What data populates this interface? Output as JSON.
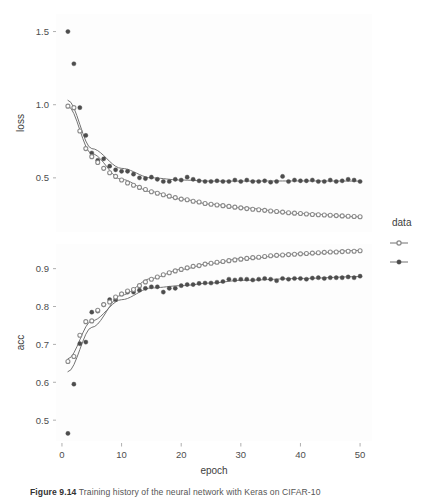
{
  "figure": {
    "caption_label": "Figure 9.14",
    "caption_text": "Training history of the neural network with Keras on CIFAR-10"
  },
  "legend": {
    "title": "data",
    "items": [
      {
        "label": "",
        "marker": "open-circle"
      },
      {
        "label": "",
        "marker": "filled-circle"
      }
    ]
  },
  "axes": {
    "xlabel": "epoch",
    "x_ticks": [
      "0",
      "10",
      "20",
      "30",
      "40",
      "50"
    ],
    "loss_label": "loss",
    "loss_ticks": [
      "1.5",
      "1.0",
      "0.5"
    ],
    "acc_label": "acc",
    "acc_ticks": [
      "0.9",
      "0.8",
      "0.7",
      "0.6",
      "0.5"
    ]
  },
  "colors": {
    "validation": "#4d4d4d",
    "training": "#8a8a8a",
    "smooth_line": "#737373",
    "panel_background": "#fdfdfd",
    "text": "#4d4d4d"
  },
  "chart_data": {
    "type": "scatter",
    "title": "",
    "xlabel": "epoch",
    "panels": [
      {
        "name": "loss",
        "ylabel": "loss",
        "ylim": [
          0.13,
          1.62
        ],
        "yticks": [
          0.5,
          1.0,
          1.5
        ],
        "xlim": [
          -1,
          52
        ],
        "xticks": [
          0,
          10,
          20,
          30,
          40,
          50
        ],
        "grid": false,
        "series": [
          {
            "name": "validation",
            "marker": "filled-circle",
            "x": [
              1,
              2,
              3,
              4,
              5,
              6,
              7,
              8,
              9,
              10,
              11,
              12,
              13,
              14,
              15,
              16,
              17,
              18,
              19,
              20,
              21,
              22,
              23,
              24,
              25,
              26,
              27,
              28,
              29,
              30,
              31,
              32,
              33,
              34,
              35,
              36,
              37,
              38,
              39,
              40,
              41,
              42,
              43,
              44,
              45,
              46,
              47,
              48,
              49,
              50
            ],
            "y": [
              1.5,
              1.28,
              0.98,
              0.79,
              0.67,
              0.62,
              0.63,
              0.58,
              0.555,
              0.545,
              0.545,
              0.525,
              0.5,
              0.495,
              0.505,
              0.49,
              0.475,
              0.475,
              0.49,
              0.485,
              0.505,
              0.49,
              0.48,
              0.475,
              0.475,
              0.48,
              0.475,
              0.475,
              0.485,
              0.475,
              0.485,
              0.475,
              0.475,
              0.48,
              0.47,
              0.475,
              0.51,
              0.475,
              0.485,
              0.48,
              0.48,
              0.485,
              0.475,
              0.475,
              0.485,
              0.475,
              0.48,
              0.49,
              0.485,
              0.475
            ]
          },
          {
            "name": "training",
            "marker": "open-circle",
            "x": [
              1,
              2,
              3,
              4,
              5,
              6,
              7,
              8,
              9,
              10,
              11,
              12,
              13,
              14,
              15,
              16,
              17,
              18,
              19,
              20,
              21,
              22,
              23,
              24,
              25,
              26,
              27,
              28,
              29,
              30,
              31,
              32,
              33,
              34,
              35,
              36,
              37,
              38,
              39,
              40,
              41,
              42,
              43,
              44,
              45,
              46,
              47,
              48,
              49,
              50
            ],
            "y": [
              0.99,
              0.98,
              0.82,
              0.7,
              0.645,
              0.605,
              0.565,
              0.535,
              0.51,
              0.485,
              0.465,
              0.45,
              0.435,
              0.42,
              0.405,
              0.395,
              0.385,
              0.375,
              0.365,
              0.355,
              0.35,
              0.34,
              0.335,
              0.325,
              0.32,
              0.315,
              0.31,
              0.305,
              0.3,
              0.295,
              0.29,
              0.285,
              0.282,
              0.278,
              0.274,
              0.27,
              0.266,
              0.262,
              0.259,
              0.256,
              0.253,
              0.25,
              0.248,
              0.246,
              0.244,
              0.242,
              0.24,
              0.238,
              0.236,
              0.234
            ]
          }
        ],
        "smooths": [
          {
            "name": "validation-smooth",
            "y_at": [
              [
                1,
                1.03
              ],
              [
                5,
                0.7
              ],
              [
                10,
                0.565
              ],
              [
                15,
                0.5
              ],
              [
                20,
                0.485
              ],
              [
                25,
                0.478
              ],
              [
                30,
                0.478
              ],
              [
                40,
                0.479
              ],
              [
                50,
                0.478
              ]
            ]
          },
          {
            "name": "training-smooth",
            "y_at": [
              [
                1,
                0.99
              ],
              [
                5,
                0.665
              ],
              [
                10,
                0.49
              ],
              [
                15,
                0.405
              ],
              [
                20,
                0.355
              ],
              [
                25,
                0.32
              ],
              [
                30,
                0.295
              ],
              [
                40,
                0.256
              ],
              [
                50,
                0.234
              ]
            ]
          }
        ]
      },
      {
        "name": "acc",
        "ylabel": "acc",
        "ylim": [
          0.445,
          0.965
        ],
        "yticks": [
          0.5,
          0.6,
          0.7,
          0.8,
          0.9
        ],
        "xlim": [
          -1,
          52
        ],
        "xticks": [
          0,
          10,
          20,
          30,
          40,
          50
        ],
        "grid": false,
        "series": [
          {
            "name": "validation",
            "marker": "filled-circle",
            "x": [
              1,
              2,
              3,
              4,
              5,
              6,
              7,
              8,
              9,
              10,
              11,
              12,
              13,
              14,
              15,
              16,
              17,
              18,
              19,
              20,
              21,
              22,
              23,
              24,
              25,
              26,
              27,
              28,
              29,
              30,
              31,
              32,
              33,
              34,
              35,
              36,
              37,
              38,
              39,
              40,
              41,
              42,
              43,
              44,
              45,
              46,
              47,
              48,
              49,
              50
            ],
            "y": [
              0.465,
              0.595,
              0.702,
              0.706,
              0.785,
              0.788,
              0.805,
              0.818,
              0.818,
              0.833,
              0.838,
              0.838,
              0.843,
              0.848,
              0.852,
              0.852,
              0.838,
              0.848,
              0.848,
              0.855,
              0.858,
              0.858,
              0.861,
              0.862,
              0.862,
              0.864,
              0.866,
              0.872,
              0.87,
              0.872,
              0.872,
              0.87,
              0.872,
              0.874,
              0.872,
              0.868,
              0.874,
              0.872,
              0.874,
              0.874,
              0.872,
              0.875,
              0.876,
              0.874,
              0.876,
              0.876,
              0.876,
              0.878,
              0.876,
              0.88
            ]
          },
          {
            "name": "training",
            "marker": "open-circle",
            "x": [
              1,
              2,
              3,
              4,
              5,
              6,
              7,
              8,
              9,
              10,
              11,
              12,
              13,
              14,
              15,
              16,
              17,
              18,
              19,
              20,
              21,
              22,
              23,
              24,
              25,
              26,
              27,
              28,
              29,
              30,
              31,
              32,
              33,
              34,
              35,
              36,
              37,
              38,
              39,
              40,
              41,
              42,
              43,
              44,
              45,
              46,
              47,
              48,
              49,
              50
            ],
            "y": [
              0.655,
              0.668,
              0.724,
              0.76,
              0.762,
              0.79,
              0.805,
              0.812,
              0.825,
              0.833,
              0.841,
              0.845,
              0.855,
              0.865,
              0.872,
              0.878,
              0.884,
              0.889,
              0.894,
              0.898,
              0.902,
              0.906,
              0.908,
              0.912,
              0.914,
              0.917,
              0.919,
              0.921,
              0.923,
              0.925,
              0.927,
              0.929,
              0.93,
              0.932,
              0.934,
              0.935,
              0.936,
              0.937,
              0.938,
              0.939,
              0.94,
              0.941,
              0.942,
              0.943,
              0.944,
              0.944,
              0.945,
              0.946,
              0.946,
              0.947
            ]
          }
        ],
        "smooths": [
          {
            "name": "validation-smooth",
            "y_at": [
              [
                1,
                0.662
              ],
              [
                5,
                0.762
              ],
              [
                10,
                0.818
              ],
              [
                15,
                0.849
              ],
              [
                20,
                0.855
              ],
              [
                25,
                0.862
              ],
              [
                30,
                0.869
              ],
              [
                40,
                0.874
              ],
              [
                50,
                0.879
              ]
            ]
          },
          {
            "name": "training-smooth",
            "y_at": [
              [
                1,
                0.628
              ],
              [
                5,
                0.745
              ],
              [
                10,
                0.83
              ],
              [
                15,
                0.874
              ],
              [
                20,
                0.898
              ],
              [
                25,
                0.914
              ],
              [
                30,
                0.926
              ],
              [
                40,
                0.939
              ],
              [
                50,
                0.948
              ]
            ]
          }
        ]
      }
    ]
  }
}
